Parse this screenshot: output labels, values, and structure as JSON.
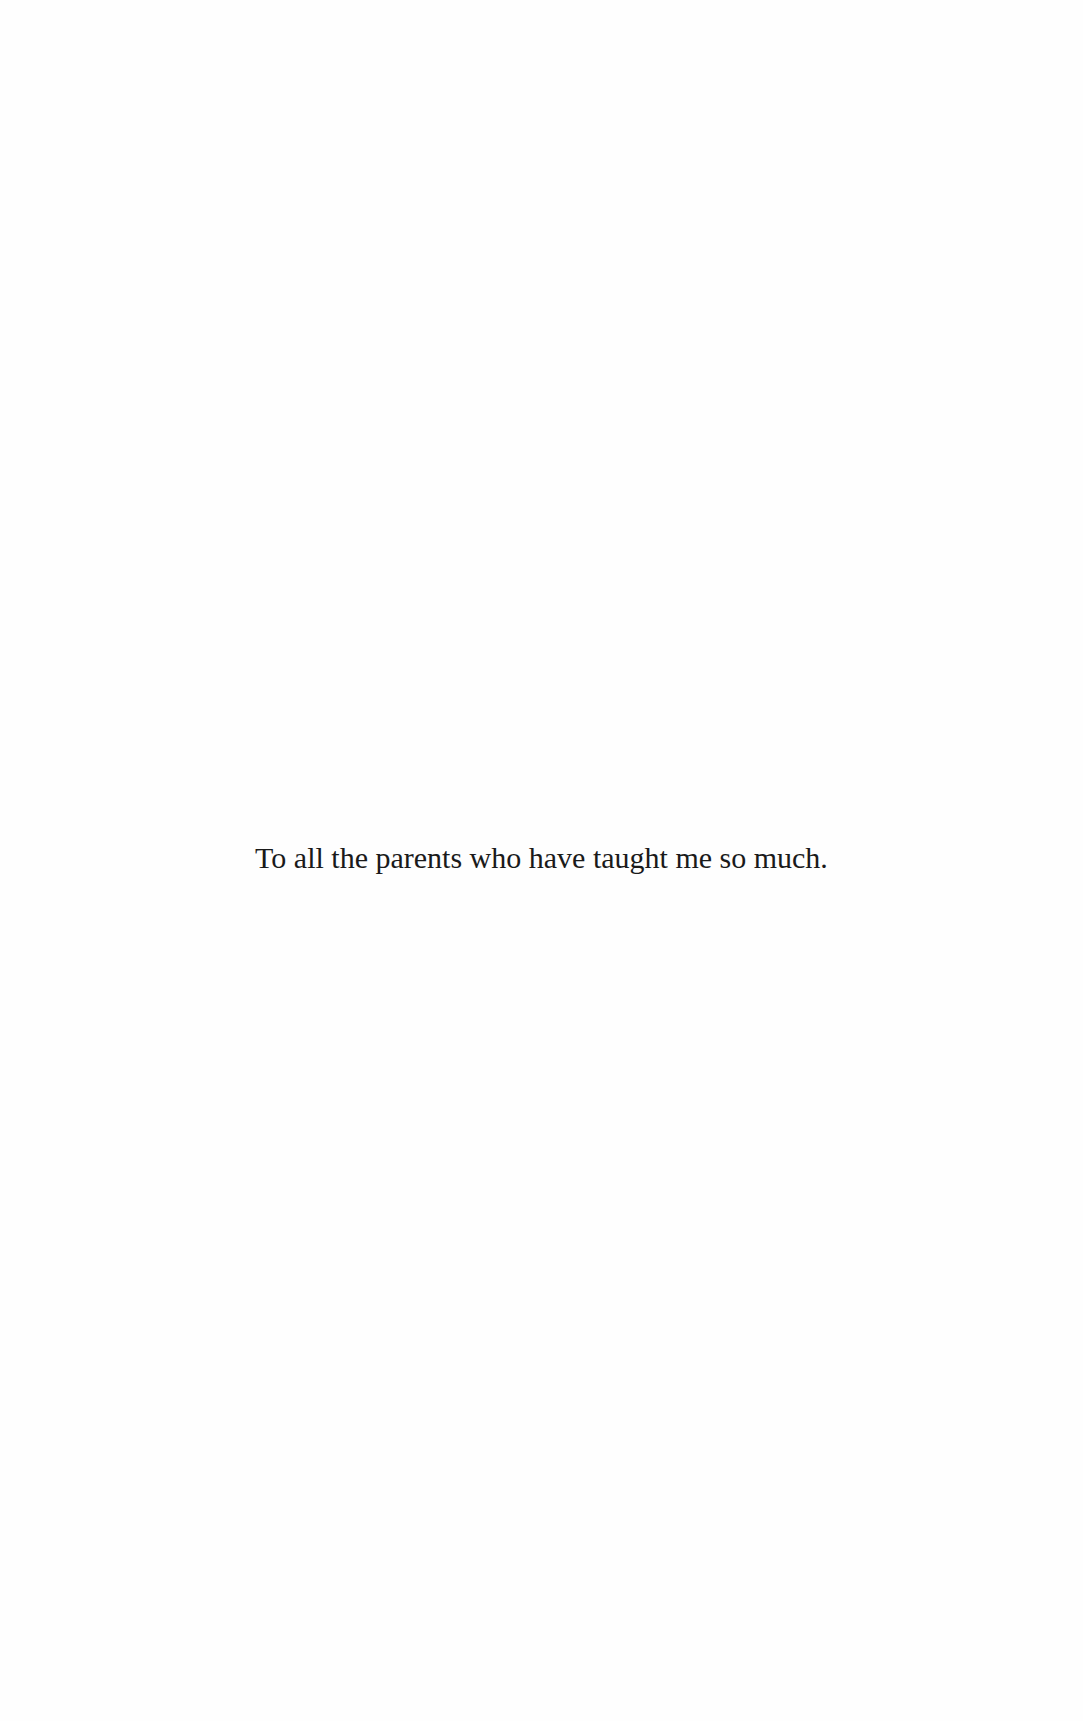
{
  "page": {
    "type": "dedication",
    "background_color": "#fefefe",
    "text_color": "#1a1a1a"
  },
  "dedication": {
    "text": "To all the parents who have taught me so much."
  }
}
